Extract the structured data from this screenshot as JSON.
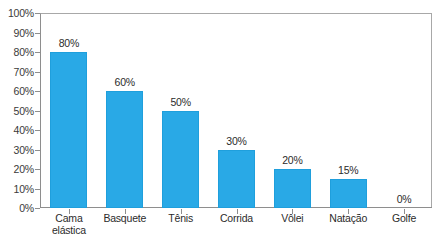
{
  "chart_data": {
    "type": "bar",
    "title": "",
    "subtitle": "",
    "xlabel": "",
    "ylabel": "",
    "categories": [
      "Cama elástica",
      "Basquete",
      "Tênis",
      "Corrida",
      "Vôlei",
      "Natação",
      "Golfe"
    ],
    "values": [
      80,
      60,
      50,
      30,
      20,
      15,
      0
    ],
    "value_labels": [
      "80%",
      "60%",
      "50%",
      "30%",
      "20%",
      "15%",
      "0%"
    ],
    "ylim": [
      0,
      100
    ],
    "ytick_values": [
      0,
      10,
      20,
      30,
      40,
      50,
      60,
      70,
      80,
      90,
      100
    ],
    "ytick_labels": [
      "0%",
      "10%",
      "20%",
      "30%",
      "40%",
      "50%",
      "60%",
      "70%",
      "80%",
      "90%",
      "100%"
    ],
    "grid": false,
    "legend": false,
    "legend_position": "none",
    "series": [
      {
        "name": "",
        "values": [
          80,
          60,
          50,
          30,
          20,
          15,
          0
        ],
        "color": "#29a9e6"
      }
    ],
    "bar_color": "#29a9e6",
    "axis_color": "#8e8e8e",
    "background": "#ffffff"
  }
}
